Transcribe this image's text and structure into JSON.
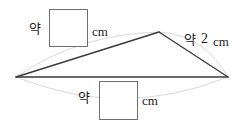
{
  "figure": {
    "name": "triangle-with-blank-measurement-labels",
    "background_color": "#ffffff",
    "stroke_color": "#3a3a3a",
    "guide_color": "#d7d7da",
    "box_border_color": "#6e6e73",
    "triangle": {
      "left_vertex": {
        "x": 16,
        "y": 77
      },
      "apex_vertex": {
        "x": 159,
        "y": 32
      },
      "right_vertex": {
        "x": 228,
        "y": 77
      }
    },
    "guides": [
      {
        "name": "left-side-guide-arc",
        "from": "left_vertex",
        "to": "apex_vertex",
        "bulge": "up"
      },
      {
        "name": "right-side-guide-arc",
        "from": "apex_vertex",
        "to": "right_vertex",
        "bulge": "up"
      },
      {
        "name": "base-guide-arc",
        "from": "left_vertex",
        "to": "right_vertex",
        "bulge": "down"
      }
    ]
  },
  "labels": {
    "top": {
      "name": "top-side-measurement-label",
      "approx_word": "약",
      "value": "",
      "unit": "cm"
    },
    "right": {
      "name": "right-side-measurement-label",
      "approx_word": "약",
      "value": "2",
      "unit": "cm"
    },
    "bottom": {
      "name": "bottom-side-measurement-label",
      "approx_word": "약",
      "value": "",
      "unit": "cm"
    }
  }
}
